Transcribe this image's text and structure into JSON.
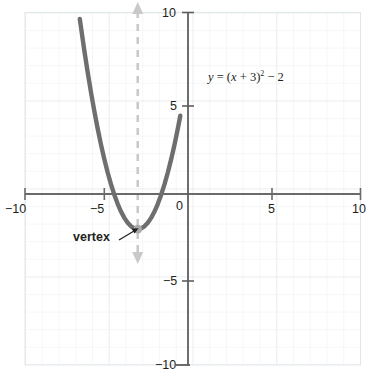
{
  "chart_data": {
    "type": "line",
    "title": "",
    "subtitle": "",
    "xlabel": "",
    "ylabel": "",
    "xlim": [
      -10,
      10
    ],
    "ylim": [
      -10,
      10
    ],
    "grid": true,
    "grid_step": 1,
    "legend": "none",
    "equation_label": {
      "lead": "y",
      "eq": " = (",
      "var": "x",
      "plus": " + 3)",
      "exp": "2",
      "tail": " − 2",
      "plain": "y = (x + 3)² − 2"
    },
    "annotations": [
      {
        "name": "vertex",
        "text": "vertex",
        "point": [
          -3,
          -2
        ],
        "leader": true
      },
      {
        "name": "axis-of-symmetry",
        "text": "",
        "x": -3,
        "style": "dashed",
        "arrows": "both",
        "color": "#c9c9c9"
      }
    ],
    "series": [
      {
        "name": "parabola",
        "expression": "y = (x + 3)^2 - 2",
        "color": "#6e6e6e",
        "width": 4,
        "vertex": [
          -3,
          -2
        ],
        "roots": [
          -4.414,
          -1.586
        ],
        "x": [
          -6.46,
          -6.2,
          -6.0,
          -5.8,
          -5.6,
          -5.4,
          -5.2,
          -5.0,
          -4.8,
          -4.6,
          -4.4,
          -4.2,
          -4.0,
          -3.8,
          -3.6,
          -3.4,
          -3.2,
          -3.0,
          -2.8,
          -2.6,
          -2.4,
          -2.2,
          -2.0,
          -1.8,
          -1.6,
          -1.4,
          -1.2,
          -1.0,
          -0.8,
          -0.6,
          -0.46
        ],
        "y": [
          9.97,
          8.24,
          7.0,
          5.84,
          4.76,
          3.76,
          2.84,
          2.0,
          1.24,
          0.56,
          -0.04,
          -0.56,
          -1.0,
          -1.36,
          -1.64,
          -1.84,
          -1.96,
          -2.0,
          -1.96,
          -1.84,
          -1.64,
          -1.36,
          -1.0,
          -0.56,
          -0.04,
          0.56,
          1.24,
          2.0,
          2.84,
          3.76,
          4.46
        ]
      }
    ],
    "x_ticks": [
      {
        "value": -10,
        "label": "−10"
      },
      {
        "value": -5,
        "label": "−5"
      },
      {
        "value": 0,
        "label": "0"
      },
      {
        "value": 5,
        "label": "5"
      },
      {
        "value": 10,
        "label": "10"
      }
    ],
    "y_ticks": [
      {
        "value": 10,
        "label": "10"
      },
      {
        "value": 5,
        "label": "5"
      },
      {
        "value": -5,
        "label": "−5"
      },
      {
        "value": -10,
        "label": "−10"
      }
    ],
    "colors": {
      "curve": "#6e6e6e",
      "axis": "#595959",
      "grid": "#e9ecef",
      "symmetry": "#c9c9c9",
      "text": "#231f20"
    }
  }
}
